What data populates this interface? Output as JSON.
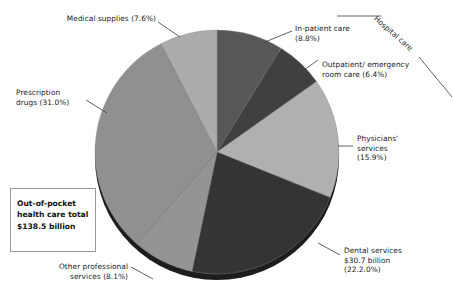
{
  "chart_data": {
    "type": "pie",
    "title": "",
    "total_label": "Out-of-pocket\nhealth care total\n$138.5 billion",
    "total_value": 138.5,
    "total_units": "billion",
    "currency": "$",
    "start_angle_deg": 0,
    "direction": "clockwise",
    "legend": "none",
    "labels_position": "outside-with-leader-lines",
    "categories": [
      "In-patient care",
      "Outpatient/ emergency room care",
      "Physicians' services",
      "Dental services",
      "Other professional services",
      "Prescription drugs",
      "Medical supplies"
    ],
    "values": [
      8.8,
      6.4,
      15.9,
      22.2,
      8.1,
      31.0,
      7.6
    ],
    "colors": [
      "#575757",
      "#404040",
      "#b0b0b0",
      "#343434",
      "#949494",
      "#909090",
      "#ababab"
    ],
    "slices": [
      {
        "name": "In-patient care",
        "percent": 8.8,
        "percent_text": "(8.8%)",
        "color": "#575757"
      },
      {
        "name": "Outpatient/ emergency room care",
        "percent": 6.4,
        "percent_text": "(6.4%)",
        "color": "#404040"
      },
      {
        "name": "Physicians' services",
        "percent": 15.9,
        "percent_text": "(15.9%)",
        "color": "#b0b0b0"
      },
      {
        "name": "Dental services",
        "percent": 22.2,
        "percent_text": "(22.2.0%)",
        "color": "#343434",
        "value_text": "$30.7 billion",
        "value": 30.7
      },
      {
        "name": "Other professional services",
        "percent": 8.1,
        "percent_text": "(8.1%)",
        "color": "#949494"
      },
      {
        "name": "Prescription drugs",
        "percent": 31.0,
        "percent_text": "(31.0%)",
        "color": "#909090"
      },
      {
        "name": "Medical supplies",
        "percent": 7.6,
        "percent_text": "(7.6%)",
        "color": "#ababab"
      }
    ],
    "grouping_bracket": {
      "label": "Hospital care",
      "groups": [
        "In-patient care",
        "Outpatient/ emergency room care"
      ]
    }
  },
  "labels": {
    "medical_supplies": "Medical supplies (7.6%)",
    "prescription_drugs": "Prescription\ndrugs (31.0%)",
    "in_patient": "In-patient care\n(8.8%)",
    "outpatient": "Outpatient/ emergency\nroom care (6.4%)",
    "physicians": "Physicians'\nservices\n(15.9%)",
    "dental": "Dental services\n$30.7 billion\n(22.2.0%)",
    "other_professional": "Other professional\nservices (8.1%)",
    "hospital_care": "Hospital care"
  },
  "callout": {
    "text": "Out-of-pocket\nhealth care total\n$138.5 billion"
  }
}
